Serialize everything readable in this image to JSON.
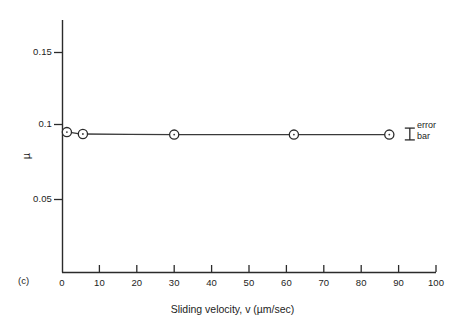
{
  "figure": {
    "panel_label": "(c)",
    "annotation": {
      "error_bar_line1": "error",
      "error_bar_line2": "bar"
    }
  },
  "chart_data": {
    "type": "line",
    "title": "",
    "xlabel": "Sliding velocity, v (µm/sec)",
    "ylabel": "µ",
    "xlim": [
      0,
      100
    ],
    "ylim": [
      0,
      0.17
    ],
    "grid": false,
    "legend": null,
    "xticks": [
      0,
      10,
      20,
      30,
      40,
      50,
      60,
      70,
      80,
      90,
      100
    ],
    "xticklabels": [
      "0",
      "10",
      "20",
      "30",
      "40",
      "50",
      "60",
      "70",
      "80",
      "90",
      "100"
    ],
    "yticks": [
      0.05,
      0.1,
      0.15
    ],
    "yticklabels": [
      "0.05",
      "0.1",
      "0.15"
    ],
    "series": [
      {
        "name": "friction coefficient",
        "marker": "open-circle",
        "x": [
          1.3,
          5.6,
          30.0,
          62.0,
          87.5
        ],
        "y": [
          0.0955,
          0.0942,
          0.0938,
          0.0938,
          0.0938
        ]
      }
    ],
    "annotations": [
      {
        "name": "error-bar",
        "type": "errorbar-capped",
        "x": 93.0,
        "y_center": 0.0942,
        "y_low": 0.0902,
        "y_high": 0.0982,
        "label": "error bar"
      }
    ]
  },
  "axes_px": {
    "x0": 62,
    "x100": 436,
    "y_axis_top": 20,
    "y_axis_bottom": 272,
    "y015": 52,
    "y010": 124,
    "y005": 199
  }
}
